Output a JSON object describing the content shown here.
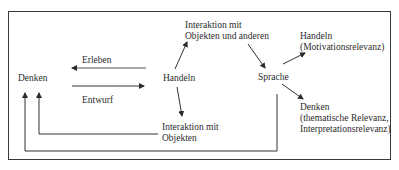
{
  "diagram": {
    "nodes": {
      "denken": "Denken",
      "handeln": "Handeln",
      "sprache": "Sprache",
      "interaktion_objekten_anderen": [
        "Interaktion mit",
        "Objekten und anderen"
      ],
      "interaktion_objekten": [
        "Interaktion mit",
        "Objekten"
      ],
      "handeln_motivation": [
        "Handeln",
        "(Motivationsrelevanz)"
      ],
      "denken_thematisch": [
        "Denken",
        "(thematische Relevanz,",
        "Interpretationsrelevanz)"
      ]
    },
    "edges": {
      "erleben": "Erleben",
      "entwurf": "Entwurf"
    },
    "colors": {
      "line": "#3a3a3a",
      "text": "#2b2b2b",
      "background": "#ffffff"
    }
  }
}
